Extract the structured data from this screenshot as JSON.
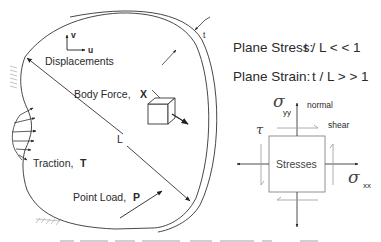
{
  "labels": {
    "displacement_v": "v",
    "displacement_u": "u",
    "displacements": "Displacements",
    "thickness": "t",
    "body_force": "Body Force,",
    "body_force_symbol": "X",
    "length": "L",
    "traction": "Traction,",
    "traction_symbol": "T",
    "point_load": "Point Load,",
    "point_load_symbol": "P"
  },
  "conditions": {
    "plane_stress": "Plane Stress:",
    "plane_stress_ratio": "t / L < < 1",
    "plane_strain": "Plane Strain:",
    "plane_strain_ratio": "t / L > > 1"
  },
  "stress_element": {
    "center_label": "Stresses",
    "sigma_symbol": "σ",
    "sigma_yy_sub": "yy",
    "sigma_xx_sub": "xx",
    "tau_symbol": "τ",
    "normal_label": "normal",
    "shear_label": "shear"
  },
  "colors": {
    "line": "#333333",
    "light_line": "#888888",
    "hatch": "#aaaaaa"
  }
}
